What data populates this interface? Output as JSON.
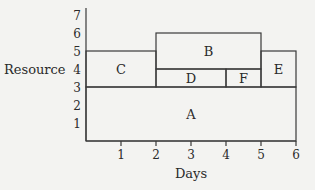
{
  "chart_data": {
    "type": "diagram",
    "title": "",
    "xlabel": "Days",
    "ylabel": "Resource",
    "xlim": [
      0,
      6
    ],
    "ylim": [
      0,
      7
    ],
    "x_ticks": [
      "1",
      "2",
      "3",
      "4",
      "5",
      "6"
    ],
    "y_ticks": [
      "1",
      "2",
      "3",
      "4",
      "5",
      "6",
      "7"
    ],
    "grid": false,
    "blocks": [
      {
        "label": "A",
        "x0": 0,
        "x1": 6,
        "y0": 0,
        "y1": 3
      },
      {
        "label": "B",
        "x0": 2,
        "x1": 5,
        "y0": 4,
        "y1": 6
      },
      {
        "label": "C",
        "x0": 0,
        "x1": 2,
        "y0": 3,
        "y1": 5
      },
      {
        "label": "D",
        "x0": 2,
        "x1": 4,
        "y0": 3,
        "y1": 4
      },
      {
        "label": "E",
        "x0": 5,
        "x1": 6,
        "y0": 3,
        "y1": 5
      },
      {
        "label": "F",
        "x0": 4,
        "x1": 5,
        "y0": 3,
        "y1": 4
      }
    ]
  },
  "axes": {
    "x_label": "Days",
    "y_label": "Resource"
  }
}
